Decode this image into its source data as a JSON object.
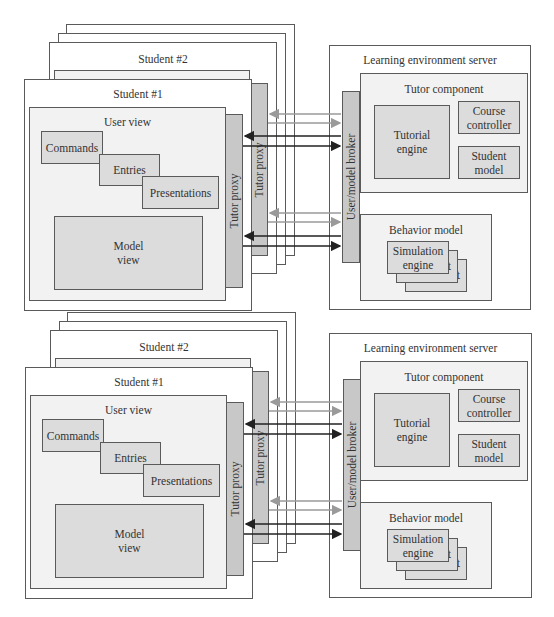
{
  "diagrams": [
    {
      "student_stack": {
        "back_frame_count": 2,
        "student2_title": "Student #2",
        "student2_user_view_partial": "User View",
        "student1_title": "Student #1",
        "user_view_title": "User view",
        "commands": "Commands",
        "entries": "Entries",
        "presentations": "Presentations",
        "model_view": "Model\nview",
        "tutor_proxy_front": "Tutor proxy",
        "tutor_proxy_back": "Tutor proxy"
      },
      "server": {
        "title": "Learning environment server",
        "broker": "User/model broker",
        "tutor_component": {
          "title": "Tutor component",
          "tutorial_engine": "Tutorial\nengine",
          "course_controller": "Course\ncontroller",
          "student_model": "Student\nmodel"
        },
        "behavior_model": {
          "title": "Behavior model",
          "simulation_engine": "Simulation\nengine",
          "stack_suffix_1": "t",
          "stack_suffix_2": "t"
        }
      },
      "connections": [
        {
          "from": "User/model broker",
          "to": "Tutor proxy (Student #2)",
          "color": "#9a9a9a"
        },
        {
          "from": "Tutor proxy (Student #2)",
          "to": "User/model broker",
          "color": "#9a9a9a"
        },
        {
          "from": "User/model broker",
          "to": "Tutor proxy (Student #1)",
          "color": "#222222"
        },
        {
          "from": "Tutor proxy (Student #1)",
          "to": "User/model broker",
          "color": "#222222"
        }
      ]
    },
    {
      "student_stack": {
        "back_frame_count": 2,
        "student2_title": "Student #2",
        "student2_user_view_partial": "User View",
        "student1_title": "Student #1",
        "user_view_title": "User view",
        "commands": "Commands",
        "entries": "Entries",
        "presentations": "Presentations",
        "model_view": "Model\nview",
        "tutor_proxy_front": "Tutor proxy",
        "tutor_proxy_back": "Tutor proxy"
      },
      "server": {
        "title": "Learning environment server",
        "broker": "User/model broker",
        "tutor_component": {
          "title": "Tutor component",
          "tutorial_engine": "Tutorial\nengine",
          "course_controller": "Course\ncontroller",
          "student_model": "Student\nmodel"
        },
        "behavior_model": {
          "title": "Behavior model",
          "simulation_engine": "Simulation\nengine",
          "stack_suffix_1": "t",
          "stack_suffix_2": "t"
        }
      }
    }
  ],
  "colors": {
    "border": "#5a5a5a",
    "light_fill": "#f2f2f2",
    "medium_fill": "#dcdcdc",
    "dark_fill": "#c8c8c8",
    "arrow_dark": "#222222",
    "arrow_light": "#9a9a9a"
  }
}
